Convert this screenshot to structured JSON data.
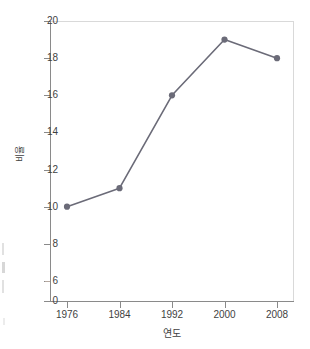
{
  "chart_data": {
    "type": "line",
    "title": "",
    "subtitle": "",
    "xlabel": "연도",
    "ylabel": "비율",
    "categories": [
      "1976",
      "1984",
      "1992",
      "2000",
      "2008"
    ],
    "x": [
      1976,
      1984,
      1992,
      2000,
      2008
    ],
    "values": [
      10,
      11,
      16,
      19,
      18
    ],
    "series": [
      {
        "name": "비율",
        "values": [
          10,
          11,
          16,
          19,
          18
        ]
      }
    ],
    "xtick_labels": [
      "1976",
      "1984",
      "1992",
      "2000",
      "2008"
    ],
    "ytick_labels": [
      "0",
      "6",
      "8",
      "10",
      "12",
      "14",
      "16",
      "18",
      "20"
    ],
    "ytick_values": [
      0,
      6,
      8,
      10,
      12,
      14,
      16,
      18,
      20
    ],
    "ylim": [
      6,
      20
    ],
    "xlim": [
      1976,
      2008
    ],
    "y_axis_broken": true,
    "y_axis_break_note": "axis break between 0 and 6",
    "grid": false,
    "legend": false,
    "legend_position": "none",
    "marker": "circle",
    "colors": {
      "line": "#6b6b78",
      "marker": "#6b6b78",
      "axis": "#8a8a8a",
      "frame": "#d9d9d9",
      "text": "#3f3f3f",
      "background": "#ffffff"
    }
  }
}
